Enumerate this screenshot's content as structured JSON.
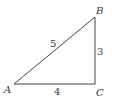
{
  "diagram": {
    "type": "right-triangle",
    "stroke_color": "#444444",
    "vertices": [
      {
        "name": "A",
        "x": 14,
        "y": 84,
        "label_x": 4,
        "label_y": 93
      },
      {
        "name": "B",
        "x": 95,
        "y": 17,
        "label_x": 96,
        "label_y": 14
      },
      {
        "name": "C",
        "x": 95,
        "y": 84,
        "label_x": 96,
        "label_y": 96
      }
    ],
    "sides": [
      {
        "between": "AB",
        "length": "5",
        "label_x": 50,
        "label_y": 47
      },
      {
        "between": "BC",
        "length": "3",
        "label_x": 97,
        "label_y": 55
      },
      {
        "between": "AC",
        "length": "4",
        "label_x": 54,
        "label_y": 95
      }
    ],
    "right_angle_at": "C"
  }
}
